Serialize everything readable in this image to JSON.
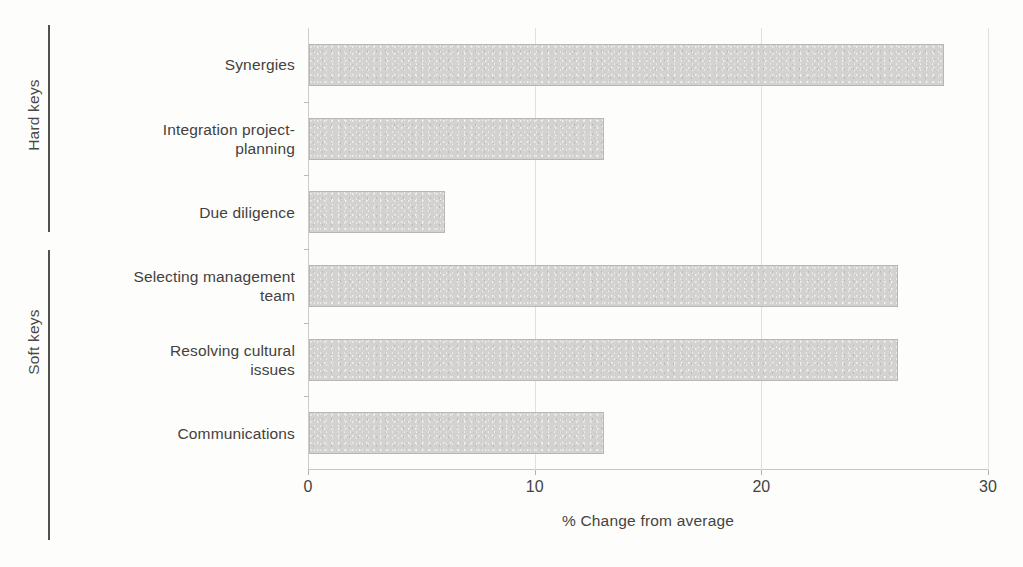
{
  "chart_data": {
    "type": "bar",
    "orientation": "horizontal",
    "title": "",
    "xlabel": "% Change from average",
    "ylabel": "",
    "xlim": [
      0,
      30
    ],
    "xticks": [
      0,
      10,
      20,
      30
    ],
    "xtick_labels": [
      "0",
      "10",
      "20",
      "30"
    ],
    "grid": true,
    "grid_axis": "x",
    "legend": false,
    "categories": [
      "Synergies",
      "Integration project-planning",
      "Due diligence",
      "Selecting management team",
      "Resolving cultural issues",
      "Communications"
    ],
    "values": [
      28,
      13,
      6,
      26,
      26,
      13
    ],
    "groups": [
      {
        "name": "Hard keys",
        "categories": [
          "Synergies",
          "Integration project-planning",
          "Due diligence"
        ]
      },
      {
        "name": "Soft keys",
        "categories": [
          "Selecting management team",
          "Resolving cultural issues",
          "Communications"
        ]
      }
    ],
    "bar_color": "#d3d2d0",
    "bar_edge_color": "#b9b7b4"
  },
  "groups": {
    "hard": "Hard keys",
    "soft": "Soft keys"
  },
  "categories": [
    {
      "line1": "Synergies",
      "line2": ""
    },
    {
      "line1": "Integration project-",
      "line2": "planning"
    },
    {
      "line1": "Due diligence",
      "line2": ""
    },
    {
      "line1": "Selecting management",
      "line2": "team"
    },
    {
      "line1": "Resolving cultural",
      "line2": "issues"
    },
    {
      "line1": "Communications",
      "line2": ""
    }
  ],
  "axis": {
    "x_title": "% Change from average",
    "ticks": [
      "0",
      "10",
      "20",
      "30"
    ]
  }
}
